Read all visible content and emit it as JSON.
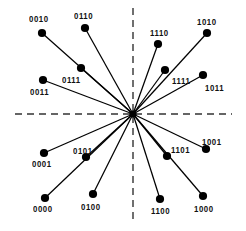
{
  "figure": {
    "name": "constellation-diagram",
    "type": "scatter-radial",
    "width": 246,
    "height": 231,
    "background_color": "#ffffff",
    "point_color": "#000000",
    "line_color": "#000000",
    "axis_color": "#333333",
    "label_color": "#111111"
  },
  "axes": {
    "origin": {
      "x": 133,
      "y": 114
    },
    "horizontal": {
      "name": "horizontal-axis",
      "style": "dashed",
      "x1": 15,
      "y1": 114,
      "x2": 232,
      "y2": 114
    },
    "vertical": {
      "name": "vertical-axis",
      "style": "dashed",
      "x1": 133,
      "y1": 8,
      "x2": 133,
      "y2": 222
    }
  },
  "chart_data": {
    "type": "scatter",
    "title": "",
    "xlabel": "",
    "ylabel": "",
    "grid": false,
    "legend": null,
    "origin": {
      "x": 133,
      "y": 114
    },
    "points": [
      {
        "label": "0010",
        "x": 42,
        "y": 33,
        "label_x": 29,
        "label_y": 14
      },
      {
        "label": "0110",
        "x": 85,
        "y": 28,
        "label_x": 74,
        "label_y": 11
      },
      {
        "label": "1110",
        "x": 158,
        "y": 44,
        "label_x": 150,
        "label_y": 28
      },
      {
        "label": "1010",
        "x": 207,
        "y": 33,
        "label_x": 197,
        "label_y": 17
      },
      {
        "label": "0111",
        "x": 81,
        "y": 68,
        "label_x": 62,
        "label_y": 75
      },
      {
        "label": "1111",
        "x": 165,
        "y": 70,
        "label_x": 172,
        "label_y": 76
      },
      {
        "label": "0011",
        "x": 43,
        "y": 80,
        "label_x": 30,
        "label_y": 87
      },
      {
        "label": "1011",
        "x": 203,
        "y": 75,
        "label_x": 205,
        "label_y": 83
      },
      {
        "label": "0101",
        "x": 86,
        "y": 157,
        "label_x": 73,
        "label_y": 146
      },
      {
        "label": "1101",
        "x": 167,
        "y": 156,
        "label_x": 171,
        "label_y": 145
      },
      {
        "label": "0001",
        "x": 44,
        "y": 153,
        "label_x": 32,
        "label_y": 159
      },
      {
        "label": "1001",
        "x": 206,
        "y": 149,
        "label_x": 202,
        "label_y": 137
      },
      {
        "label": "0000",
        "x": 45,
        "y": 198,
        "label_x": 33,
        "label_y": 204
      },
      {
        "label": "0100",
        "x": 93,
        "y": 194,
        "label_x": 81,
        "label_y": 202
      },
      {
        "label": "1100",
        "x": 160,
        "y": 199,
        "label_x": 151,
        "label_y": 206
      },
      {
        "label": "1000",
        "x": 203,
        "y": 196,
        "label_x": 194,
        "label_y": 204
      }
    ]
  }
}
